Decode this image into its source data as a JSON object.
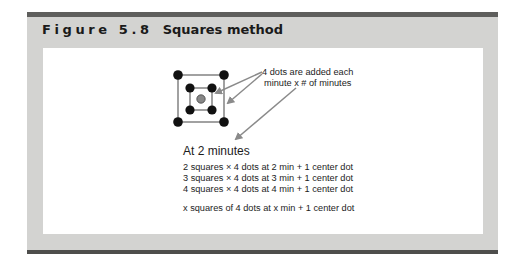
{
  "figure": {
    "label": "Figure 5.8",
    "title": "Squares method"
  },
  "diagram": {
    "outer_square_dots": 4,
    "inner_square_dots": 4,
    "center_dot": 1,
    "annotation": [
      "4 dots are added each",
      "minute x # of minutes"
    ],
    "colors": {
      "dot": "#111111",
      "center_dot": "#888888",
      "square_line": "#8a8a8a",
      "arrow": "#8a8a8a",
      "panel": "#d3d3d1",
      "bars": "#5e5e5c"
    }
  },
  "text": {
    "heading": "At 2 minutes",
    "lines": [
      "2 squares × 4 dots at 2 min + 1 center dot",
      "3 squares × 4 dots at 3 min + 1 center dot",
      "4 squares × 4 dots at 4 min + 1 center dot"
    ],
    "general": "x squares of 4 dots at x min + 1 center dot"
  }
}
